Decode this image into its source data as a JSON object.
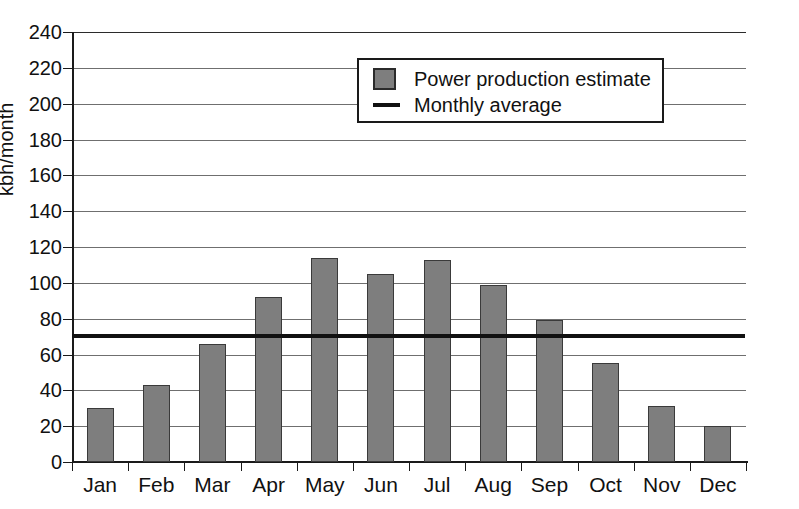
{
  "chart_data": {
    "type": "bar",
    "title": "",
    "xlabel": "",
    "ylabel": "kbh/month",
    "ylim": [
      0,
      240
    ],
    "ytick_step": 20,
    "grid": true,
    "legend_position": "top-center",
    "categories": [
      "Jan",
      "Feb",
      "Mar",
      "Apr",
      "May",
      "Jun",
      "Jul",
      "Aug",
      "Sep",
      "Oct",
      "Nov",
      "Dec"
    ],
    "yticks": [
      "0",
      "20",
      "40",
      "60",
      "80",
      "100",
      "120",
      "140",
      "160",
      "180",
      "200",
      "220",
      "240"
    ],
    "series": [
      {
        "name": "Power production estimate",
        "type": "bar",
        "color": "#7e7e7e",
        "values": [
          30,
          43,
          66,
          92,
          114,
          105,
          113,
          99,
          79,
          55,
          31,
          20
        ]
      },
      {
        "name": "Monthly average",
        "type": "line",
        "color": "#111111",
        "value": 70.6
      }
    ]
  },
  "legend": {
    "items": [
      {
        "label": "Power production estimate",
        "marker": "filled-square",
        "color": "#7e7e7e"
      },
      {
        "label": "Monthly average",
        "marker": "horizontal-line",
        "color": "#111111"
      }
    ]
  },
  "axis": {
    "y_title": "kbh/month"
  }
}
